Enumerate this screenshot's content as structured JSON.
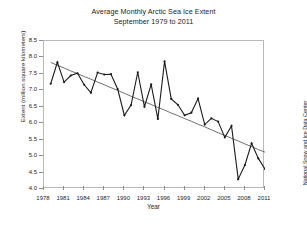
{
  "title": {
    "line1": "Average Monthly Arctic Sea Ice Extent",
    "line2": "September 1979 to 2011"
  },
  "axes": {
    "ylabel": "Extent (million square kilometers)",
    "xlabel": "Year",
    "yticks": [
      "8.5",
      "8.0",
      "7.5",
      "7.0",
      "6.5",
      "6.0",
      "5.5",
      "5.0",
      "4.5",
      "4.0"
    ],
    "xticks": [
      "1978",
      "1981",
      "1984",
      "1987",
      "1990",
      "1993",
      "1996",
      "1999",
      "2002",
      "2005",
      "2008",
      "2011"
    ]
  },
  "credit": "National Snow and Ice Data Center",
  "colors": {
    "series": "#1a1a1a",
    "trend": "#4a4a4a",
    "frame": "#b9b9b9",
    "background": "#ffffff"
  },
  "chart_data": {
    "type": "line",
    "title": "Average Monthly Arctic Sea Ice Extent September 1979 to 2011",
    "xlabel": "Year",
    "ylabel": "Extent (million square kilometers)",
    "xlim": [
      1978,
      2011
    ],
    "ylim": [
      4.0,
      8.5
    ],
    "grid": false,
    "legend": null,
    "x": [
      1979,
      1980,
      1981,
      1982,
      1983,
      1984,
      1985,
      1986,
      1987,
      1988,
      1989,
      1990,
      1991,
      1992,
      1993,
      1994,
      1995,
      1996,
      1997,
      1998,
      1999,
      2000,
      2001,
      2002,
      2003,
      2004,
      2005,
      2006,
      2007,
      2008,
      2009,
      2010,
      2011
    ],
    "series": [
      {
        "name": "September sea ice extent",
        "marker": true,
        "values": [
          7.2,
          7.85,
          7.25,
          7.45,
          7.52,
          7.17,
          6.93,
          7.54,
          7.48,
          7.49,
          7.04,
          6.24,
          6.55,
          7.55,
          6.5,
          7.18,
          6.13,
          7.88,
          6.74,
          6.56,
          6.24,
          6.32,
          6.75,
          5.96,
          6.15,
          6.05,
          5.57,
          5.92,
          4.3,
          4.73,
          5.39,
          4.93,
          4.61
        ]
      },
      {
        "name": "Linear trend",
        "marker": false,
        "values": [
          7.85,
          7.76,
          7.68,
          7.59,
          7.51,
          7.42,
          7.34,
          7.25,
          7.17,
          7.08,
          7.0,
          6.91,
          6.82,
          6.74,
          6.65,
          6.57,
          6.48,
          6.4,
          6.31,
          6.23,
          6.14,
          6.06,
          5.97,
          5.89,
          5.8,
          5.71,
          5.63,
          5.54,
          5.46,
          5.37,
          5.29,
          5.2,
          5.12
        ]
      }
    ]
  }
}
